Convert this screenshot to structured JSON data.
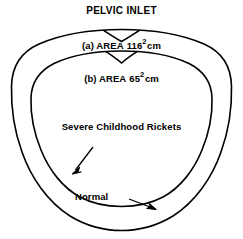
{
  "figure": {
    "title": "PELVIC INLET",
    "stroke_color": "#000000",
    "background_color": "#ffffff",
    "outer_shape_name": "Normal",
    "inner_shape_name": "Severe Childhood Rickets"
  },
  "labels": {
    "area_outer": {
      "marker": "(a)",
      "word": "AREA",
      "value": "116",
      "exponent": "2",
      "unit": "cm"
    },
    "area_inner": {
      "marker": "(b)",
      "word": "AREA",
      "value": "65",
      "exponent": "2",
      "unit": "cm"
    },
    "rickets": "Severe Childhood Rickets",
    "normal": "Normal"
  },
  "annotations": [
    {
      "name": "rickets-arrow",
      "target": "inner-pelvic-outline",
      "direction": "down-left"
    },
    {
      "name": "normal-arrow",
      "target": "outer-pelvic-outline",
      "direction": "down-right"
    }
  ]
}
